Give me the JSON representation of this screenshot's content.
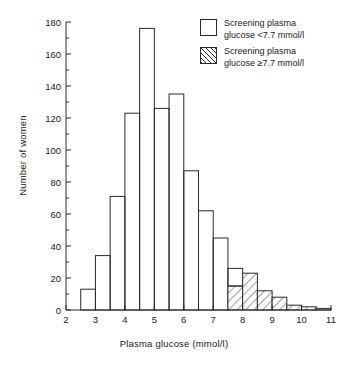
{
  "chart_data": {
    "type": "bar",
    "title": "",
    "subtitle": "",
    "xlabel": "Plasma glucose (mmol/l)",
    "ylabel": "Number of women",
    "xlim": [
      2,
      11
    ],
    "ylim": [
      0,
      180
    ],
    "grid": false,
    "legend_position": "top-right",
    "x_ticks": [
      "2",
      "3",
      "4",
      "5",
      "6",
      "7",
      "8",
      "9",
      "10",
      "11"
    ],
    "x_tick_values": [
      2,
      3,
      4,
      5,
      6,
      7,
      8,
      9,
      10,
      11
    ],
    "x_minor_tick_values": [
      2.5,
      3.5,
      4.5,
      5.5,
      6.5,
      7.5,
      8.5,
      9.5,
      10.5
    ],
    "y_ticks": [
      "0",
      "20",
      "40",
      "60",
      "80",
      "100",
      "120",
      "140",
      "160",
      "180"
    ],
    "y_tick_values": [
      0,
      20,
      40,
      60,
      80,
      100,
      120,
      140,
      160,
      180
    ],
    "y_minor_tick_values": [
      10,
      30,
      50,
      70,
      90,
      110,
      130,
      150,
      170
    ],
    "bin_width": 0.5,
    "bin_edges": [
      2.5,
      3.0,
      3.5,
      4.0,
      4.5,
      5.0,
      5.5,
      6.0,
      6.5,
      7.0,
      7.5,
      8.0,
      8.5,
      9.0,
      9.5,
      10.0,
      10.5,
      11.0
    ],
    "categories": [
      "2.5-3.0",
      "3.0-3.5",
      "3.5-4.0",
      "4.0-4.5",
      "4.5-5.0",
      "5.0-5.5",
      "5.5-6.0",
      "6.0-6.5",
      "6.5-7.0",
      "7.0-7.5",
      "7.5-8.0",
      "8.0-8.5",
      "8.5-9.0",
      "9.0-9.5",
      "9.5-10.0",
      "10.0-10.5",
      "10.5-11.0"
    ],
    "values": [
      13,
      34,
      71,
      123,
      176,
      126,
      135,
      87,
      62,
      45,
      26,
      23,
      12,
      8,
      3,
      2,
      1
    ],
    "series": [
      {
        "name": "Screening plasma glucose <7.7 mmol/l",
        "style": "open",
        "values": [
          13,
          34,
          71,
          123,
          176,
          126,
          135,
          87,
          62,
          45,
          11,
          0,
          0,
          0,
          0,
          0,
          0
        ]
      },
      {
        "name": "Screening plasma glucose ≥7.7 mmol/l",
        "style": "hatched",
        "values": [
          0,
          0,
          0,
          0,
          0,
          0,
          0,
          0,
          0,
          0,
          15,
          23,
          12,
          8,
          3,
          2,
          1
        ]
      }
    ]
  },
  "legend": {
    "items": [
      {
        "label": "Screening plasma\nglucose <7.7 mmol/l",
        "style": "open"
      },
      {
        "label": "Screening plasma\nglucose ≥7.7 mmol/l",
        "style": "hatched"
      }
    ]
  },
  "style": {
    "axis_color": "#2a2a2a",
    "bar_outline": "#2a2a2a",
    "bar_fill": "#ffffff",
    "hatch_color": "#2a2a2a",
    "text_color": "#1a1a1a",
    "background": "#ffffff"
  }
}
